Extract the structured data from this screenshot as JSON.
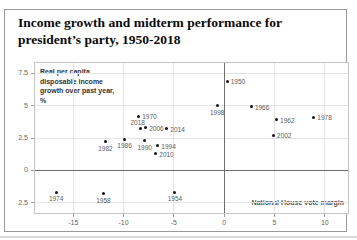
{
  "card": {
    "title": "Income growth and midterm performance for president’s party, 1950-2018"
  },
  "chart_data": {
    "type": "scatter",
    "title": "Income growth and midterm performance for president’s party, 1950-2018",
    "xlabel": "National House vote margin",
    "ylabel": "Real per capita disposable income growth over past year, %",
    "xlim": [
      -18.8,
      12.3
    ],
    "ylim": [
      -3.3,
      8.3
    ],
    "grid": true,
    "legend": "none",
    "x_ticks": [
      {
        "v": -15,
        "label": "-15"
      },
      {
        "v": -10,
        "label": "-10"
      },
      {
        "v": -5,
        "label": "-5"
      },
      {
        "v": 0,
        "label": "0"
      },
      {
        "v": 5,
        "label": "5"
      },
      {
        "v": 10,
        "label": "10"
      }
    ],
    "y_ticks": [
      {
        "v": 7.5,
        "label": "7.5"
      },
      {
        "v": 5,
        "label": "5"
      },
      {
        "v": 2.5,
        "label": "2.5"
      },
      {
        "v": 0,
        "label": "0"
      },
      {
        "v": -2.5,
        "label": "2.5"
      }
    ],
    "zero_axis": {
      "x": 0,
      "y": 0
    },
    "points": [
      {
        "year": "1950",
        "x": 0.3,
        "y": 6.9,
        "label_pos": "right"
      },
      {
        "year": "1954",
        "x": -4.9,
        "y": -1.7,
        "label_pos": "below"
      },
      {
        "year": "1958",
        "x": -12.0,
        "y": -1.8,
        "label_pos": "below"
      },
      {
        "year": "1962",
        "x": 5.2,
        "y": 3.9,
        "label_pos": "right"
      },
      {
        "year": "1966",
        "x": 2.7,
        "y": 4.9,
        "label_pos": "right"
      },
      {
        "year": "1970",
        "x": -8.5,
        "y": 4.2,
        "label_pos": "right"
      },
      {
        "year": "1974",
        "x": -16.7,
        "y": -1.7,
        "label_pos": "below"
      },
      {
        "year": "1978",
        "x": 8.9,
        "y": 4.1,
        "label_pos": "right"
      },
      {
        "year": "1982",
        "x": -11.8,
        "y": 2.2,
        "label_pos": "below"
      },
      {
        "year": "1986",
        "x": -9.9,
        "y": 2.4,
        "label_pos": "below"
      },
      {
        "year": "1990",
        "x": -7.9,
        "y": 2.3,
        "label_pos": "below"
      },
      {
        "year": "1994",
        "x": -6.6,
        "y": 1.9,
        "label_pos": "right"
      },
      {
        "year": "1998",
        "x": -0.7,
        "y": 5.0,
        "label_pos": "below"
      },
      {
        "year": "2002",
        "x": 4.9,
        "y": 2.7,
        "label_pos": "right"
      },
      {
        "year": "2006",
        "x": -7.8,
        "y": 3.3,
        "label_pos": "right"
      },
      {
        "year": "2010",
        "x": -6.8,
        "y": 1.3,
        "label_pos": "right"
      },
      {
        "year": "2014",
        "x": -5.7,
        "y": 3.2,
        "label_pos": "right"
      },
      {
        "year": "2018",
        "x": -8.3,
        "y": 3.2,
        "label_pos": "above"
      }
    ],
    "colors": {
      "dot": "#141414",
      "point_label": "#5c5c5c",
      "grid": "#e4e4e4",
      "zero_axis": "#6e6e6e",
      "tick_text": "#666666",
      "frame": "#c4c4c4",
      "ylabel_text": "#333333",
      "xlabel_text": "#555555"
    }
  }
}
